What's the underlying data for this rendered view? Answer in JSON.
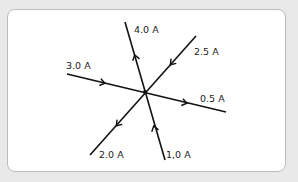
{
  "diagram": {
    "junction": {
      "x": 145,
      "y": 92
    },
    "colors": {
      "background": "#e9e9e9",
      "card": "#ffffff",
      "line": "#111111",
      "text": "#222222"
    },
    "wires": [
      {
        "id": "top",
        "label": "4.0 A",
        "direction": "out"
      },
      {
        "id": "upper-right",
        "label": "2.5 A",
        "direction": "in"
      },
      {
        "id": "left",
        "label": "3.0 A",
        "direction": "in"
      },
      {
        "id": "right",
        "label": "0.5 A",
        "direction": "out"
      },
      {
        "id": "lower-left",
        "label": "2.0 A",
        "direction": "out"
      },
      {
        "id": "bottom",
        "label": "1,0 A",
        "direction": "in"
      }
    ]
  }
}
